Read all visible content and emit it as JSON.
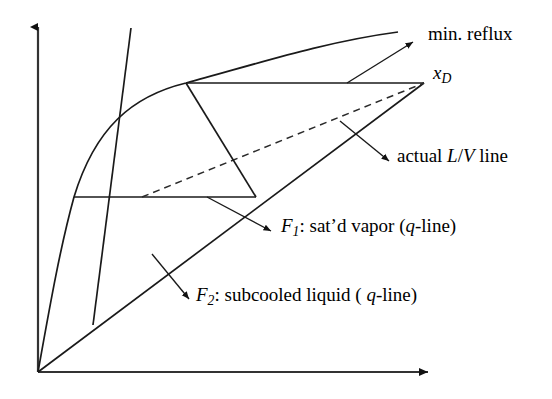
{
  "figure": {
    "type": "mccabe-thiele-distillation-diagram",
    "background_color": "#ffffff",
    "line_color": "#1a1a1a",
    "width": 552,
    "height": 399
  },
  "axes": {
    "y_axis": {
      "name": "vertical-axis",
      "arrow": "up",
      "x": 38,
      "y_top": 20,
      "y_bottom": 372
    },
    "x_axis": {
      "name": "horizontal-axis",
      "arrow": "right",
      "y": 372,
      "x_left": 38,
      "x_right": 441
    },
    "origin": {
      "x": 38,
      "y": 372
    }
  },
  "curves": {
    "equilibrium_curve": {
      "name": "equilibrium-curve",
      "path": "M 38,372 C 52,300 62,250 74,197 C 96,130 130,96 186,83 C 248,66 320,42 398,32"
    },
    "diagonal_45": {
      "name": "forty-five-degree-line",
      "from": [
        38,
        372
      ],
      "to": [
        424,
        83
      ]
    },
    "min_reflux_line": {
      "name": "minimum-reflux-operating-line",
      "from": [
        186,
        83
      ],
      "to": [
        424,
        83
      ],
      "style": "solid-horizontal"
    },
    "actual_lv_line": {
      "name": "actual-lv-operating-line",
      "from": [
        142,
        197
      ],
      "to": [
        424,
        83
      ],
      "style": "dashed"
    },
    "q_line_f1": {
      "name": "q-line-f1-saturated-vapor",
      "from": [
        255,
        197
      ],
      "to": [
        186,
        83
      ],
      "style": "solid"
    },
    "q_line_f2": {
      "name": "q-line-f2-subcooled-liquid",
      "from": [
        93,
        325
      ],
      "to": [
        130,
        30
      ],
      "style": "solid"
    },
    "stage_horizontal_lower": {
      "name": "stage-horizontal-line",
      "from": [
        74,
        197
      ],
      "to": [
        255,
        197
      ],
      "style": "solid-horizontal"
    }
  },
  "leaders": [
    {
      "name": "leader-min-reflux",
      "from": [
        347,
        83
      ],
      "to": [
        415,
        41
      ]
    },
    {
      "name": "leader-actual-lv",
      "from": [
        340,
        122
      ],
      "to": [
        390,
        162
      ]
    },
    {
      "name": "leader-f1",
      "from": [
        207,
        197
      ],
      "to": [
        272,
        232
      ]
    },
    {
      "name": "leader-f2",
      "from": [
        152,
        255
      ],
      "to": [
        190,
        300
      ]
    }
  ],
  "labels": {
    "min_reflux": "min. reflux",
    "xd_base": "x",
    "xd_sub": "D",
    "actual_prefix": "actual ",
    "actual_L": "L",
    "actual_slash": "/",
    "actual_V": "V",
    "actual_suffix": " line",
    "f1_base": "F",
    "f1_sub": "1",
    "f1_text_a": ": sat’d vapor (",
    "f1_q": "q",
    "f1_text_b": "-line)",
    "f2_base": "F",
    "f2_sub": "2",
    "f2_text_a": ": subcooled liquid ( ",
    "f2_q": "q",
    "f2_text_b": "-line)"
  }
}
